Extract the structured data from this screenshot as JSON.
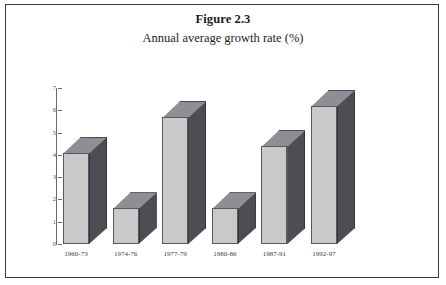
{
  "figure": {
    "title": "Figure 2.3",
    "subtitle": "Annual average growth rate (%)"
  },
  "chart_data": {
    "type": "bar",
    "title": "Figure 2.3",
    "subtitle": "Annual average growth rate (%)",
    "xlabel": "",
    "ylabel": "",
    "ylim": [
      0,
      7
    ],
    "yticks": [
      "0",
      "1",
      "2",
      "3",
      "4",
      "5",
      "6",
      "7"
    ],
    "grid": false,
    "legend": "none",
    "style": "3d-bar",
    "categories": [
      "1960-73",
      "1974-76",
      "1977-79",
      "1980-86",
      "1987-91",
      "1992-97"
    ],
    "values": [
      4.1,
      1.6,
      5.7,
      1.6,
      4.4,
      6.2
    ],
    "colors": {
      "bar_front": "#c9c9c9",
      "bar_side": "#4d4d53",
      "bar_top": "#8e8e94",
      "axis": "#6a6a72",
      "text": "#1b1b1b",
      "frame": "#3a3a42",
      "background": "#ffffff"
    }
  }
}
